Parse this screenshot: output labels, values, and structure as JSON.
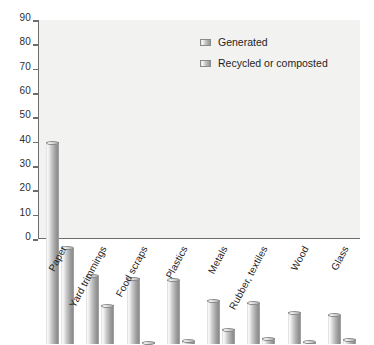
{
  "chart_data": {
    "type": "bar",
    "title": "",
    "subtitle": "",
    "xlabel": "",
    "ylabel": "",
    "ylim": [
      0,
      90
    ],
    "yticks": [
      0,
      10,
      20,
      30,
      40,
      50,
      60,
      70,
      80,
      90
    ],
    "grid": false,
    "legend_position": "upper-right",
    "categories": [
      "Paper",
      "Yard trimmings",
      "Food scraps",
      "Plastics",
      "Metals",
      "Rubber, textiles",
      "Wood",
      "Glass"
    ],
    "series": [
      {
        "name": "Generated",
        "values": [
          83,
          28,
          27,
          26.5,
          18,
          17,
          13,
          12
        ]
      },
      {
        "name": "Recycled or composted",
        "values": [
          39.5,
          16,
          0.8,
          1.3,
          6,
          2.3,
          1,
          2
        ]
      }
    ]
  },
  "legend": {
    "items": [
      {
        "label": "Generated",
        "swatch": "legend-swatch-generated"
      },
      {
        "label": "Recycled or composted",
        "swatch": "legend-swatch-recycled"
      }
    ]
  },
  "colors": {
    "plot_background": "#f2f2f0",
    "axis": "#6d6d6d",
    "bar_light": "#fbfbfb",
    "bar_dark": "#8d8d8d",
    "text": "#1f1f1f"
  }
}
